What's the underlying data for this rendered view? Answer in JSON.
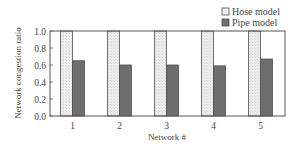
{
  "chart_data": {
    "type": "bar",
    "title": "",
    "xlabel": "Network #",
    "ylabel": "Network congestion ratio",
    "categories": [
      "1",
      "2",
      "3",
      "4",
      "5"
    ],
    "series": [
      {
        "name": "Hose model",
        "values": [
          1.0,
          1.0,
          1.0,
          1.0,
          1.0
        ],
        "color": "#e6e6e6"
      },
      {
        "name": "Pipe model",
        "values": [
          0.65,
          0.6,
          0.6,
          0.59,
          0.67
        ],
        "color": "#6e6e6e"
      }
    ],
    "ylim": [
      0.0,
      1.0
    ],
    "yticks": [
      "0.0",
      "0.2",
      "0.4",
      "0.6",
      "0.8",
      "1.0"
    ],
    "grid": false,
    "legend_position": "top-right"
  },
  "colors": {
    "axis": "#555555",
    "bar_outline": "#505050"
  }
}
